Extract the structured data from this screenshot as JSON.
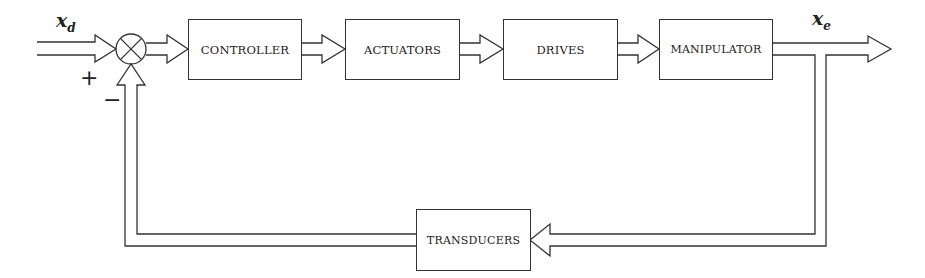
{
  "diagram": {
    "type": "block-diagram",
    "title": "",
    "blocks": {
      "controller": "CONTROLLER",
      "actuators": "ACTUATORS",
      "drives": "DRIVES",
      "manipulator": "MANIPULATOR",
      "transducers": "TRANSDUCERS"
    },
    "signals": {
      "input_symbol": "x",
      "input_subscript": "d",
      "output_symbol": "x",
      "output_subscript": "e"
    },
    "summing_junction": {
      "plus_sign": "+",
      "minus_sign": "−"
    },
    "flow": [
      "x_d → summing junction",
      "summing junction → CONTROLLER",
      "CONTROLLER → ACTUATORS",
      "ACTUATORS → DRIVES",
      "DRIVES → MANIPULATOR",
      "MANIPULATOR → x_e",
      "x_e → TRANSDUCERS (feedback)",
      "TRANSDUCERS → summing junction (negative)"
    ]
  }
}
